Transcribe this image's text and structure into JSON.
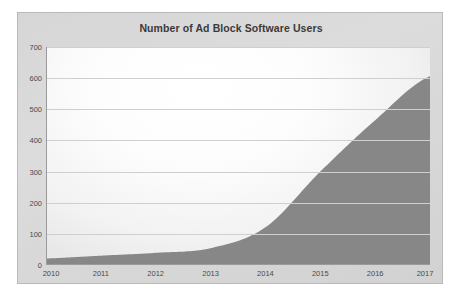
{
  "chart_data": {
    "type": "area",
    "title": "Number of Ad Block Software Users",
    "xlabel": "",
    "ylabel": "",
    "categories": [
      "2010",
      "2011",
      "2012",
      "2013",
      "2014",
      "2015",
      "2016",
      "2017"
    ],
    "x": [
      2010,
      2011,
      2012,
      2013,
      2014,
      2015,
      2016,
      2017
    ],
    "values": [
      21,
      30,
      39,
      54,
      121,
      300,
      465,
      606
    ],
    "series": [
      {
        "name": "Ad Block Software Users",
        "values": [
          21,
          30,
          39,
          54,
          121,
          300,
          465,
          606
        ]
      }
    ],
    "xlim": [
      2010,
      2017
    ],
    "ylim": [
      0,
      700
    ],
    "yticks": [
      0,
      100,
      200,
      300,
      400,
      500,
      600,
      700
    ],
    "ytick_labels": [
      "0",
      "100",
      "200",
      "300",
      "400",
      "500",
      "600",
      "700"
    ],
    "xtick_labels": [
      "2010",
      "2011",
      "2012",
      "2013",
      "2014",
      "2015",
      "2016",
      "2017"
    ],
    "grid": true,
    "grid_axis": "y",
    "legend": false,
    "legend_position": "none",
    "colors": {
      "area_fill": "#878787",
      "plot_background": "#fdfdfd",
      "chart_background": "#d8d8d8",
      "gridline": "#cfcfcf",
      "axis": "#9a9a9a",
      "title_text": "#3a3a3a",
      "tick_text": "#4a4a4a"
    }
  }
}
